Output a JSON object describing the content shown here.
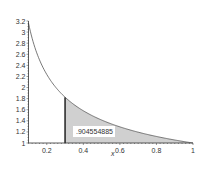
{
  "chart_data": {
    "type": "area",
    "title": "",
    "xlabel": "x",
    "ylabel": "",
    "function": "1/sqrt(x)",
    "xlim": [
      0.1,
      1
    ],
    "ylim": [
      1,
      3.2
    ],
    "shade_range": [
      0.3,
      1
    ],
    "x_ticks": [
      "0.2",
      "0.4",
      "0.6",
      "0.8",
      "1"
    ],
    "y_ticks": [
      "1",
      "1.2",
      "1.4",
      "1.6",
      "1.8",
      "2",
      "2.2",
      "2.4",
      "2.6",
      "2.8",
      "3",
      "3.2"
    ],
    "annotation": ".904554885",
    "grid": false,
    "series": [
      {
        "name": "curve",
        "x": [
          0.1,
          0.2,
          0.3,
          0.4,
          0.5,
          0.6,
          0.7,
          0.8,
          0.9,
          1.0
        ],
        "values": [
          3.162,
          2.236,
          1.826,
          1.581,
          1.414,
          1.291,
          1.195,
          1.118,
          1.054,
          1.0
        ]
      }
    ],
    "colors": {
      "curve": "#555555",
      "shade": "#d0d0d0",
      "axis": "#333333",
      "boundary_line": "#222222"
    }
  }
}
